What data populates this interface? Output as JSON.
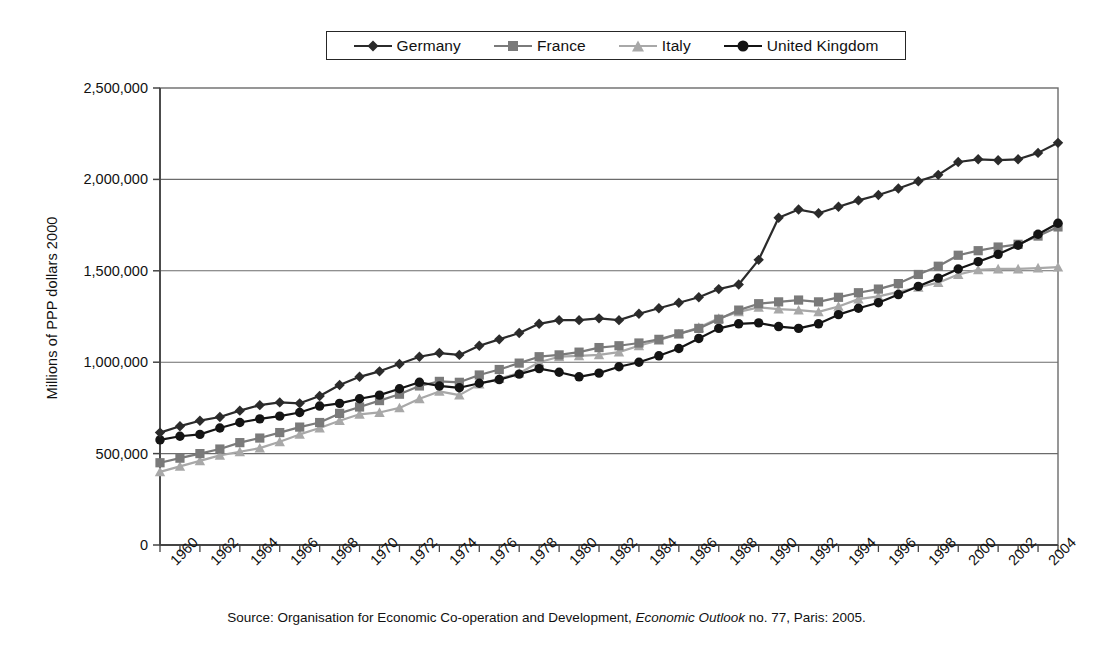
{
  "chart_data": {
    "type": "line",
    "title": "",
    "xlabel": "",
    "ylabel": "Millions of PPP dollars 2000",
    "xlim": [
      1960,
      2005
    ],
    "ylim": [
      0,
      2500000
    ],
    "grid": true,
    "legend_position": "top",
    "y_ticks": [
      0,
      500000,
      1000000,
      1500000,
      2000000,
      2500000
    ],
    "y_tick_labels": [
      "0",
      "500,000",
      "1,000,000",
      "1,500,000",
      "2,000,000",
      "2,500,000"
    ],
    "x_ticks": [
      1960,
      1961,
      1962,
      1963,
      1964,
      1965,
      1966,
      1967,
      1968,
      1969,
      1970,
      1971,
      1972,
      1973,
      1974,
      1975,
      1976,
      1977,
      1978,
      1979,
      1980,
      1981,
      1982,
      1983,
      1984,
      1985,
      1986,
      1987,
      1988,
      1989,
      1990,
      1991,
      1992,
      1993,
      1994,
      1995,
      1996,
      1997,
      1998,
      1999,
      2000,
      2001,
      2002,
      2003,
      2004,
      2005
    ],
    "x_tick_labels": [
      "1960",
      "1962",
      "1964",
      "1966",
      "1968",
      "1970",
      "1972",
      "1974",
      "1976",
      "1978",
      "1980",
      "1982",
      "1984",
      "1986",
      "1988",
      "1990",
      "1992",
      "1994",
      "1996",
      "1998",
      "2000",
      "2002",
      "2004"
    ],
    "x": [
      1960,
      1961,
      1962,
      1963,
      1964,
      1965,
      1966,
      1967,
      1968,
      1969,
      1970,
      1971,
      1972,
      1973,
      1974,
      1975,
      1976,
      1977,
      1978,
      1979,
      1980,
      1981,
      1982,
      1983,
      1984,
      1985,
      1986,
      1987,
      1988,
      1989,
      1990,
      1991,
      1992,
      1993,
      1994,
      1995,
      1996,
      1997,
      1998,
      1999,
      2000,
      2001,
      2002,
      2003,
      2004,
      2005
    ],
    "series": [
      {
        "name": "Germany",
        "marker": "diamond",
        "color": "#2b2b2b",
        "values": [
          615000,
          650000,
          680000,
          700000,
          735000,
          765000,
          780000,
          775000,
          815000,
          875000,
          920000,
          950000,
          990000,
          1030000,
          1050000,
          1040000,
          1090000,
          1125000,
          1160000,
          1210000,
          1230000,
          1230000,
          1240000,
          1230000,
          1265000,
          1295000,
          1325000,
          1355000,
          1400000,
          1425000,
          1560000,
          1790000,
          1835000,
          1815000,
          1850000,
          1885000,
          1915000,
          1950000,
          1990000,
          2025000,
          2095000,
          2110000,
          2105000,
          2110000,
          2145000,
          2200000
        ]
      },
      {
        "name": "France",
        "marker": "square",
        "color": "#7a7a7a",
        "values": [
          450000,
          475000,
          500000,
          525000,
          560000,
          585000,
          615000,
          645000,
          670000,
          720000,
          755000,
          790000,
          825000,
          870000,
          895000,
          890000,
          930000,
          960000,
          995000,
          1030000,
          1040000,
          1055000,
          1080000,
          1090000,
          1105000,
          1125000,
          1155000,
          1185000,
          1235000,
          1285000,
          1320000,
          1330000,
          1340000,
          1330000,
          1355000,
          1380000,
          1400000,
          1430000,
          1480000,
          1525000,
          1585000,
          1610000,
          1630000,
          1645000,
          1690000,
          1740000
        ]
      },
      {
        "name": "Italy",
        "marker": "triangle",
        "color": "#a8a8a8",
        "values": [
          400000,
          430000,
          460000,
          490000,
          510000,
          530000,
          565000,
          605000,
          640000,
          680000,
          715000,
          725000,
          750000,
          800000,
          840000,
          820000,
          880000,
          910000,
          940000,
          1000000,
          1030000,
          1035000,
          1040000,
          1055000,
          1090000,
          1120000,
          1155000,
          1190000,
          1240000,
          1275000,
          1300000,
          1290000,
          1285000,
          1275000,
          1305000,
          1345000,
          1360000,
          1385000,
          1410000,
          1435000,
          1480000,
          1505000,
          1510000,
          1510000,
          1515000,
          1520000
        ]
      },
      {
        "name": "United Kingdom",
        "marker": "circle",
        "color": "#141414",
        "values": [
          575000,
          595000,
          605000,
          640000,
          670000,
          690000,
          705000,
          725000,
          760000,
          775000,
          800000,
          820000,
          855000,
          890000,
          870000,
          860000,
          885000,
          905000,
          935000,
          965000,
          945000,
          920000,
          940000,
          975000,
          1000000,
          1035000,
          1075000,
          1130000,
          1185000,
          1210000,
          1215000,
          1195000,
          1185000,
          1210000,
          1260000,
          1295000,
          1325000,
          1370000,
          1415000,
          1460000,
          1510000,
          1550000,
          1590000,
          1640000,
          1700000,
          1760000
        ]
      }
    ]
  },
  "legend": {
    "entries": [
      {
        "label": "Germany",
        "marker": "diamond-marker-icon"
      },
      {
        "label": "France",
        "marker": "square-marker-icon"
      },
      {
        "label": "Italy",
        "marker": "triangle-marker-icon"
      },
      {
        "label": "United Kingdom",
        "marker": "circle-marker-icon"
      }
    ]
  },
  "axes": {
    "y_title": "Millions of PPP dollars 2000"
  },
  "source": {
    "prefix": "Source: Organisation for Economic Co-operation and Development, ",
    "italic": "Economic Outlook",
    "suffix": " no. 77, Paris: 2005."
  }
}
